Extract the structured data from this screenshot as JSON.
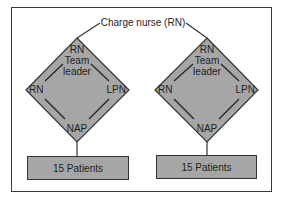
{
  "diagram": {
    "root": {
      "label": "Charge nurse (RN)"
    },
    "teams": [
      {
        "top": "RN",
        "top_role_line1": "Team",
        "top_role_line2": "leader",
        "left": "RN",
        "right": "LPN",
        "bottom": "NAP",
        "patients": "15 Patients"
      },
      {
        "top": "RN",
        "top_role_line1": "Team",
        "top_role_line2": "leader",
        "left": "RN",
        "right": "LPN",
        "bottom": "NAP",
        "patients": "15 Patients"
      }
    ],
    "colors": {
      "fill": "#a6a6a6",
      "stroke": "#333333",
      "frame": "#3a3a3a"
    }
  }
}
